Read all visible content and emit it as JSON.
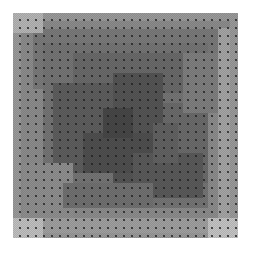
{
  "image": {
    "description": "Grayscale square texture with nested rectangular blocks of varying gray tones, overlaid with a regular dot grid and fine checker dithering, on a white background",
    "square": {
      "x": 13,
      "y": 13,
      "size": 225
    },
    "background_color": "#ffffff",
    "dot_grid_spacing_px": 8,
    "blocks": [
      {
        "x": 0,
        "y": 0,
        "w": 225,
        "h": 225,
        "color": "#9a9a9a"
      },
      {
        "x": 8,
        "y": 8,
        "w": 209,
        "h": 209,
        "color": "#8c8c8c"
      },
      {
        "x": 20,
        "y": 16,
        "w": 190,
        "h": 60,
        "color": "#7a7a7a"
      },
      {
        "x": 30,
        "y": 30,
        "w": 165,
        "h": 165,
        "color": "#757575"
      },
      {
        "x": 0,
        "y": 0,
        "w": 30,
        "h": 20,
        "color": "#b5b5b5"
      },
      {
        "x": 60,
        "y": 40,
        "w": 120,
        "h": 40,
        "color": "#6a6a6a"
      },
      {
        "x": 40,
        "y": 70,
        "w": 60,
        "h": 90,
        "color": "#5e5e5e"
      },
      {
        "x": 100,
        "y": 60,
        "w": 50,
        "h": 120,
        "color": "#555555"
      },
      {
        "x": 150,
        "y": 90,
        "w": 45,
        "h": 80,
        "color": "#6b6b6b"
      },
      {
        "x": 70,
        "y": 120,
        "w": 80,
        "h": 40,
        "color": "#4f4f4f"
      },
      {
        "x": 120,
        "y": 140,
        "w": 70,
        "h": 45,
        "color": "#5a5a5a"
      },
      {
        "x": 170,
        "y": 40,
        "w": 35,
        "h": 60,
        "color": "#7f7f7f"
      },
      {
        "x": 10,
        "y": 150,
        "w": 50,
        "h": 60,
        "color": "#8f8f8f"
      },
      {
        "x": 15,
        "y": 205,
        "w": 195,
        "h": 15,
        "color": "#a0a0a0"
      },
      {
        "x": 205,
        "y": 15,
        "w": 12,
        "h": 195,
        "color": "#a5a5a5"
      },
      {
        "x": 0,
        "y": 205,
        "w": 30,
        "h": 20,
        "color": "#c0c0c0"
      },
      {
        "x": 195,
        "y": 205,
        "w": 30,
        "h": 20,
        "color": "#c4c4c4"
      },
      {
        "x": 90,
        "y": 95,
        "w": 30,
        "h": 30,
        "color": "#474747"
      },
      {
        "x": 140,
        "y": 110,
        "w": 25,
        "h": 40,
        "color": "#626262"
      },
      {
        "x": 50,
        "y": 170,
        "w": 90,
        "h": 25,
        "color": "#717171"
      }
    ]
  }
}
